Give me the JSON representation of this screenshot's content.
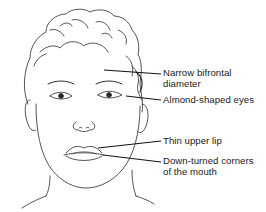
{
  "figure": {
    "line_color": "#1a1a1a",
    "background": "#ffffff"
  },
  "labels": [
    {
      "id": "bifrontal",
      "lines": [
        "Narrow bifrontal",
        "diameter"
      ],
      "top": 68
    },
    {
      "id": "eyes",
      "lines": [
        "Almond-shaped eyes"
      ],
      "top": 95
    },
    {
      "id": "upper-lip",
      "lines": [
        "Thin upper lip"
      ],
      "top": 136
    },
    {
      "id": "mouth-corners",
      "lines": [
        "Down-turned corners",
        "of the mouth"
      ],
      "top": 156
    }
  ]
}
